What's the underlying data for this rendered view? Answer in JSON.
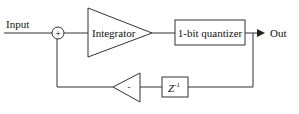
{
  "diagram": {
    "input_label": "Input",
    "output_label": "Out",
    "summer_sign": "+",
    "integrator_label": "Integrator",
    "quantizer_label": "1-bit quantizer",
    "feedback_gain_label": "-",
    "delay_label_base": "Z",
    "delay_label_exp": "-1",
    "line_color": "#333333"
  }
}
